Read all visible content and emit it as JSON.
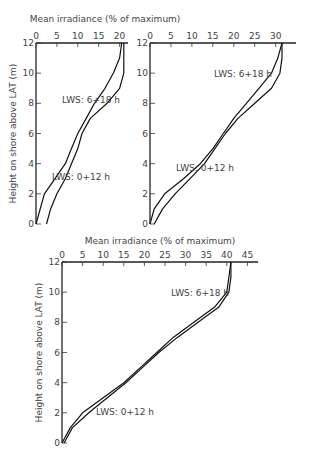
{
  "figure": {
    "ylabel": "Height on shore above LAT (m)",
    "xlabel": "Mean irradiance (% of maximum)"
  },
  "chart_data": [
    {
      "type": "line",
      "panel": "top-left",
      "xlabel": "Mean irradiance (% of maximum)",
      "ylabel": "Height on shore above LAT (m)",
      "xlim": [
        0,
        20
      ],
      "ylim": [
        0,
        12
      ],
      "xticks": [
        0,
        5,
        10,
        15,
        20
      ],
      "yticks": [
        0,
        2,
        4,
        6,
        8,
        10,
        12
      ],
      "annotations": [
        "LWS: 6+18 h",
        "LWS: 0+12 h"
      ],
      "series": [
        {
          "name": "LWS: 6+18 h",
          "points": [
            [
              20.5,
              12
            ],
            [
              20,
              11
            ],
            [
              18.5,
              10
            ],
            [
              16.5,
              9
            ],
            [
              14,
              8
            ],
            [
              12,
              7
            ],
            [
              10,
              6
            ],
            [
              8.5,
              5
            ],
            [
              7,
              4
            ],
            [
              4.5,
              3
            ],
            [
              2,
              2
            ],
            [
              0,
              0
            ]
          ]
        },
        {
          "name": "LWS: 0+12 h",
          "points": [
            [
              21,
              12
            ],
            [
              21,
              10
            ],
            [
              20,
              9
            ],
            [
              17,
              8
            ],
            [
              13,
              7
            ],
            [
              11,
              6
            ],
            [
              10,
              5
            ],
            [
              8.5,
              4
            ],
            [
              7,
              3
            ],
            [
              5,
              2
            ],
            [
              3.5,
              1
            ],
            [
              2.5,
              0
            ]
          ]
        }
      ]
    },
    {
      "type": "line",
      "panel": "top-right",
      "xlabel": "Mean irradiance (% of maximum)",
      "ylabel": "Height on shore above LAT (m)",
      "xlim": [
        0,
        32
      ],
      "ylim": [
        0,
        12
      ],
      "xticks": [
        0,
        5,
        10,
        15,
        20,
        25,
        30
      ],
      "yticks": [
        0,
        2,
        4,
        6,
        8,
        10,
        12
      ],
      "annotations": [
        "LWS: 6+18 h",
        "LWS: 0+12 h"
      ],
      "series": [
        {
          "name": "LWS: 6+18 h",
          "points": [
            [
              31.5,
              12
            ],
            [
              30.5,
              11
            ],
            [
              29,
              10
            ],
            [
              26,
              9
            ],
            [
              23,
              8
            ],
            [
              20,
              7
            ],
            [
              17.5,
              6
            ],
            [
              15,
              5
            ],
            [
              12,
              4
            ],
            [
              8,
              3
            ],
            [
              3.5,
              2
            ],
            [
              1,
              1
            ],
            [
              0,
              0
            ]
          ]
        },
        {
          "name": "LWS: 0+12 h",
          "points": [
            [
              31.5,
              12
            ],
            [
              31.5,
              11
            ],
            [
              31,
              10
            ],
            [
              29,
              9
            ],
            [
              25,
              8
            ],
            [
              21,
              7
            ],
            [
              18,
              6
            ],
            [
              15.5,
              5
            ],
            [
              13,
              4
            ],
            [
              9.5,
              3
            ],
            [
              6,
              2
            ],
            [
              3,
              1
            ],
            [
              1,
              0
            ]
          ]
        }
      ]
    },
    {
      "type": "line",
      "panel": "bottom",
      "xlabel": "Mean irradiance (% of maximum)",
      "ylabel": "Height on shore above LAT (m)",
      "xlim": [
        0,
        45
      ],
      "ylim": [
        0,
        12
      ],
      "xticks": [
        0,
        5,
        10,
        15,
        20,
        25,
        30,
        35,
        40,
        45
      ],
      "yticks": [
        0,
        2,
        4,
        6,
        8,
        10,
        12
      ],
      "annotations": [
        "LWS: 6+18 h",
        "LWS: 0+12 h"
      ],
      "series": [
        {
          "name": "LWS: 6+18 h",
          "points": [
            [
              41,
              12
            ],
            [
              40.5,
              11
            ],
            [
              40,
              10
            ],
            [
              37,
              9
            ],
            [
              32,
              8
            ],
            [
              27,
              7
            ],
            [
              23,
              6
            ],
            [
              19,
              5
            ],
            [
              15,
              4
            ],
            [
              10,
              3
            ],
            [
              5,
              2
            ],
            [
              2,
              1
            ],
            [
              0,
              0
            ]
          ]
        },
        {
          "name": "LWS: 0+12 h",
          "points": [
            [
              41,
              12
            ],
            [
              41,
              11
            ],
            [
              40.5,
              10
            ],
            [
              38,
              9
            ],
            [
              33,
              8
            ],
            [
              28,
              7
            ],
            [
              23.5,
              6
            ],
            [
              19.5,
              5
            ],
            [
              15.5,
              4
            ],
            [
              11,
              3
            ],
            [
              6.5,
              2
            ],
            [
              2.5,
              1
            ],
            [
              0.5,
              0
            ]
          ]
        }
      ]
    }
  ]
}
